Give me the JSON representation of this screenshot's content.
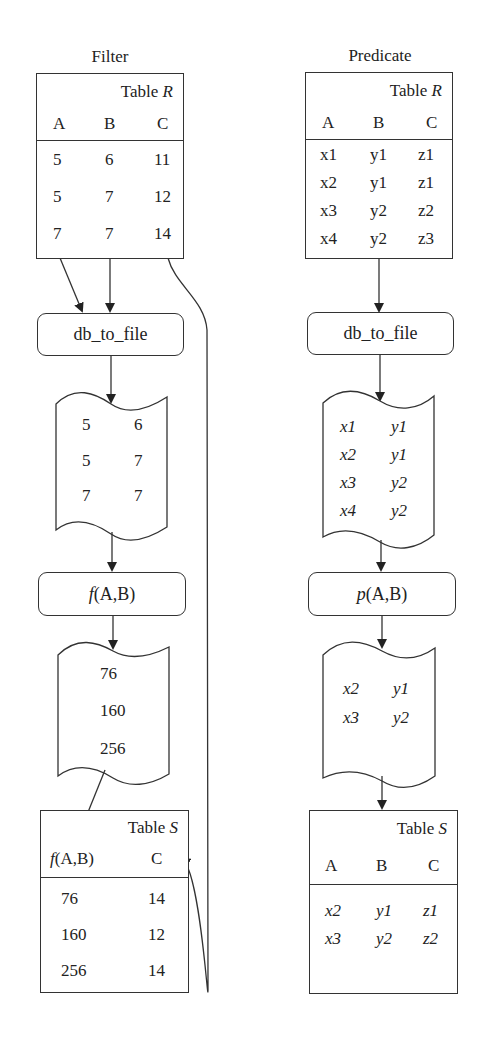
{
  "filter": {
    "title": "Filter",
    "table_r": {
      "name_prefix": "Table ",
      "name_var": "R",
      "columns": [
        "A",
        "B",
        "C"
      ],
      "rows": [
        [
          "5",
          "6",
          "11"
        ],
        [
          "5",
          "7",
          "12"
        ],
        [
          "7",
          "7",
          "14"
        ]
      ]
    },
    "step1": {
      "label": "db_to_file"
    },
    "file1": {
      "rows": [
        [
          "5",
          "6"
        ],
        [
          "5",
          "7"
        ],
        [
          "7",
          "7"
        ]
      ]
    },
    "step2": {
      "label_fn": "f",
      "label_args": "(A,B)"
    },
    "file2": {
      "rows": [
        "76",
        "160",
        "256"
      ]
    },
    "table_s": {
      "name_prefix": "Table ",
      "name_var": "S",
      "columns_fn": "f",
      "columns_args": "(A,B)",
      "column_c": "C",
      "rows": [
        [
          "76",
          "14"
        ],
        [
          "160",
          "12"
        ],
        [
          "256",
          "14"
        ]
      ]
    }
  },
  "predicate": {
    "title": "Predicate",
    "table_r": {
      "name_prefix": "Table ",
      "name_var": "R",
      "columns": [
        "A",
        "B",
        "C"
      ],
      "rows": [
        [
          "x1",
          "y1",
          "z1"
        ],
        [
          "x2",
          "y1",
          "z1"
        ],
        [
          "x3",
          "y2",
          "z2"
        ],
        [
          "x4",
          "y2",
          "z3"
        ]
      ]
    },
    "step1": {
      "label": "db_to_file"
    },
    "file1": {
      "rows": [
        [
          "x1",
          "y1"
        ],
        [
          "x2",
          "y1"
        ],
        [
          "x3",
          "y2"
        ],
        [
          "x4",
          "y2"
        ]
      ]
    },
    "step2": {
      "label_fn": "p",
      "label_args": "(A,B)"
    },
    "file2": {
      "rows": [
        [
          "x2",
          "y1"
        ],
        [
          "x3",
          "y2"
        ]
      ]
    },
    "table_s": {
      "name_prefix": "Table ",
      "name_var": "S",
      "columns": [
        "A",
        "B",
        "C"
      ],
      "rows": [
        [
          "x2",
          "y1",
          "z1"
        ],
        [
          "x3",
          "y2",
          "z2"
        ]
      ]
    }
  },
  "colors": {
    "line": "#333333",
    "text": "#222222",
    "background": "#ffffff"
  }
}
